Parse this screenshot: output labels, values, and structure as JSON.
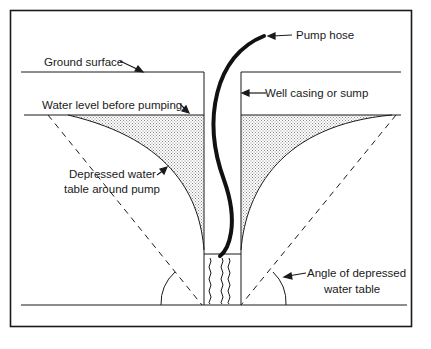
{
  "diagram": {
    "type": "well cross-section",
    "labels": {
      "pump_hose": "Pump hose",
      "ground_surface": "Ground surface",
      "well_casing": "Well casing or sump",
      "water_level": "Water level before pumping",
      "depressed_line1": "Depressed water",
      "depressed_line2": "table around pump",
      "angle_line1": "Angle of depressed",
      "angle_line2": "water table"
    },
    "colors": {
      "ink": "#1a1a1a",
      "stipple": "#9a9a9a",
      "background": "#ffffff"
    }
  }
}
